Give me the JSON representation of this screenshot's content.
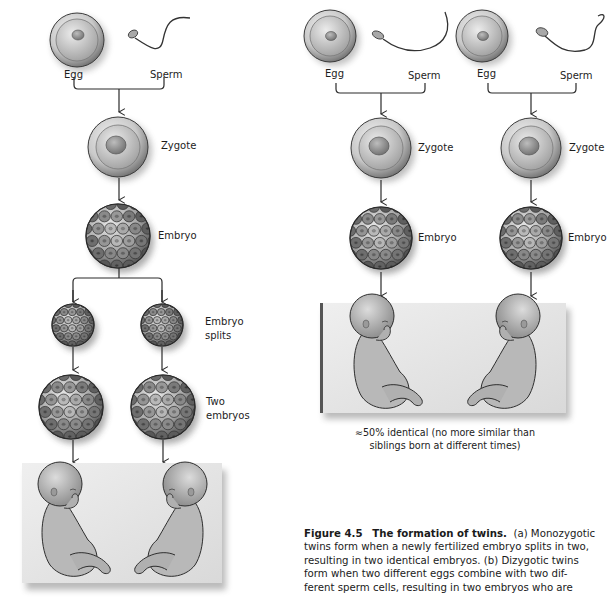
{
  "figure": {
    "number_label": "Figure 4.5",
    "title": "The formation of twins.",
    "caption_lines": [
      "(a) Monozygotic",
      "twins form when a newly fertilized embryo splits in two,",
      "resulting in two identical embryos. (b) Dizygotic twins",
      "form when two different eggs combine with two dif-",
      "ferent sperm cells, resulting in two embryos who are"
    ]
  },
  "panel_a": {
    "name": "Monozygotic twins",
    "labels": {
      "egg": "Egg",
      "sperm": "Sperm",
      "zygote": "Zygote",
      "embryo": "Embryo",
      "embryo_splits_1": "Embryo",
      "embryo_splits_2": "splits",
      "two_embryos_1": "Two",
      "two_embryos_2": "embryos"
    }
  },
  "panel_b": {
    "name": "Dizygotic twins",
    "pairs": [
      {
        "egg": "Egg",
        "sperm": "Sperm",
        "zygote": "Zygote",
        "embryo": "Embryo"
      },
      {
        "egg": "Egg",
        "sperm": "Sperm",
        "zygote": "Zygote",
        "embryo": "Embryo"
      }
    ],
    "result_caption_1": "≈50% identical (no more similar than",
    "result_caption_2": "siblings born at different times)"
  },
  "colors": {
    "line": "#2a2a2a",
    "cell_light": "#d9d9d9",
    "cell_dark": "#6e6e6e",
    "box_bg": "#e6e6e6",
    "skin": "#bcbcbc"
  }
}
